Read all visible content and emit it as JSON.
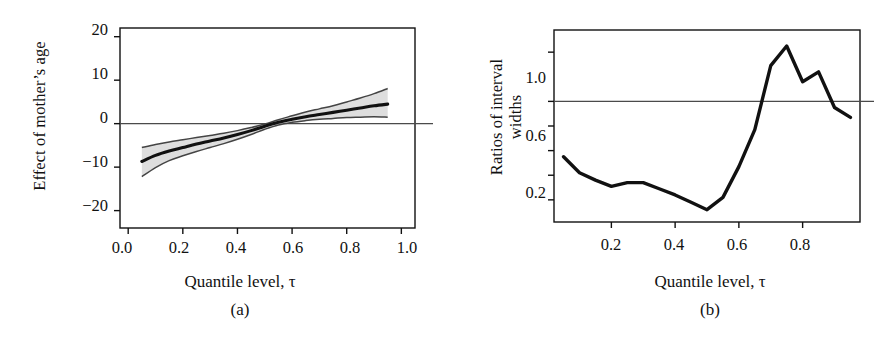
{
  "figure": {
    "background": "#ffffff",
    "ink_color": "#111111",
    "band_fill": "#d8d8d8",
    "band_edge": "#444444"
  },
  "panels": [
    {
      "id": "a",
      "caption": "(a)",
      "xtitle": "Quantile level, τ",
      "ytitle": "Effect of mother’s age",
      "xticks": [
        "0.0",
        "0.2",
        "0.4",
        "0.6",
        "0.8",
        "1.0"
      ],
      "yticks": [
        "20",
        "10",
        "0",
        "−10",
        "−20"
      ]
    },
    {
      "id": "b",
      "caption": "(b)",
      "xtitle": "Quantile level, τ",
      "ytitle_line1": "Ratios of interval",
      "ytitle_line2": "widths",
      "xticks": [
        "0.2",
        "0.4",
        "0.6",
        "0.8"
      ],
      "yticks": [
        "1.0",
        "0.6",
        "0.2"
      ]
    }
  ],
  "chart_data": [
    {
      "type": "line",
      "panel": "a",
      "title": "",
      "xlabel": "Quantile level, τ",
      "ylabel": "Effect of mother's age",
      "xlim": [
        -0.03,
        1.05
      ],
      "ylim": [
        -24,
        22
      ],
      "xticks": [
        0.0,
        0.2,
        0.4,
        0.6,
        0.8,
        1.0
      ],
      "yticks": [
        20,
        10,
        0,
        -10,
        -20
      ],
      "grid": false,
      "legend": "none",
      "annotations": [
        "horizontal reference line at y = 0"
      ],
      "reference_lines": [
        {
          "axis": "y",
          "value": 0
        }
      ],
      "x": [
        0.05,
        0.1,
        0.15,
        0.2,
        0.25,
        0.3,
        0.35,
        0.4,
        0.45,
        0.5,
        0.55,
        0.6,
        0.65,
        0.7,
        0.75,
        0.8,
        0.85,
        0.9,
        0.95
      ],
      "series": [
        {
          "name": "Estimated effect",
          "values": [
            -8.7,
            -7.3,
            -6.3,
            -5.5,
            -4.7,
            -4.0,
            -3.3,
            -2.5,
            -1.6,
            -0.6,
            0.3,
            1.0,
            1.6,
            2.1,
            2.6,
            3.1,
            3.6,
            4.1,
            4.5
          ]
        },
        {
          "name": "Pointwise confidence band, upper",
          "values": [
            -5.5,
            -4.8,
            -4.2,
            -3.7,
            -3.2,
            -2.7,
            -2.2,
            -1.6,
            -0.9,
            -0.1,
            0.9,
            1.8,
            2.7,
            3.4,
            4.1,
            5.0,
            5.9,
            6.9,
            8.1
          ]
        },
        {
          "name": "Pointwise confidence band, lower",
          "values": [
            -12.2,
            -10.1,
            -8.5,
            -7.4,
            -6.4,
            -5.5,
            -4.6,
            -3.6,
            -2.5,
            -1.3,
            -0.3,
            0.3,
            0.7,
            1.0,
            1.2,
            1.4,
            1.5,
            1.6,
            1.5
          ]
        }
      ]
    },
    {
      "type": "line",
      "panel": "b",
      "title": "",
      "xlabel": "Quantile level, τ",
      "ylabel": "Ratios of interval widths",
      "xlim": [
        0.02,
        0.98
      ],
      "ylim": [
        0.02,
        1.58
      ],
      "xticks": [
        0.2,
        0.4,
        0.6,
        0.8
      ],
      "yticks": [
        1.0,
        0.6,
        0.2
      ],
      "minor_yticks": [
        1.4,
        0.8,
        0.4
      ],
      "grid": false,
      "legend": "none",
      "annotations": [
        "horizontal reference line at y = 1.0"
      ],
      "reference_lines": [
        {
          "axis": "y",
          "value": 1.0
        }
      ],
      "x": [
        0.05,
        0.1,
        0.15,
        0.2,
        0.25,
        0.3,
        0.35,
        0.4,
        0.45,
        0.5,
        0.55,
        0.6,
        0.65,
        0.7,
        0.75,
        0.8,
        0.85,
        0.9,
        0.95
      ],
      "series": [
        {
          "name": "Ratio of interval widths",
          "values": [
            0.55,
            0.42,
            0.36,
            0.31,
            0.34,
            0.34,
            0.29,
            0.24,
            0.18,
            0.12,
            0.22,
            0.47,
            0.77,
            1.29,
            1.45,
            1.16,
            1.24,
            0.95,
            0.87
          ]
        }
      ]
    }
  ]
}
